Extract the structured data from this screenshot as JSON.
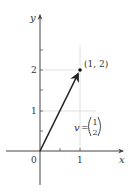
{
  "diagram": {
    "axes": {
      "x_label": "x",
      "y_label": "y",
      "origin_label": "0",
      "x_ticks": [
        {
          "value": 1,
          "label": "1"
        }
      ],
      "y_ticks": [
        {
          "value": 1,
          "label": "1"
        },
        {
          "value": 2,
          "label": "2"
        }
      ]
    },
    "vector": {
      "name": "v",
      "from": [
        0,
        0
      ],
      "to": [
        1,
        2
      ],
      "equals": "=",
      "components": [
        "1",
        "2"
      ]
    },
    "point": {
      "coords": [
        1,
        2
      ],
      "label": "(1, 2)"
    },
    "colors": {
      "axis": "#444444",
      "grid": "#d8d8d8",
      "vector": "#222222",
      "text": "#333333"
    }
  }
}
